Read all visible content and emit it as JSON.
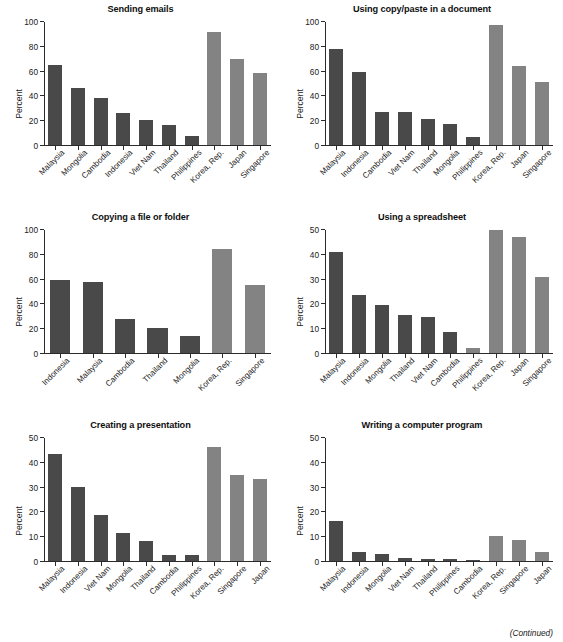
{
  "figure": {
    "footer_note": "(Continued)",
    "y_axis_label": "Percent",
    "colors": {
      "dark_bar": "#494949",
      "light_bar": "#838383",
      "axis": "#2b2b2b",
      "background": "#ffffff"
    }
  },
  "chart_data": [
    {
      "type": "bar",
      "title": "Sending emails",
      "xlabel": "",
      "ylabel": "Percent",
      "ylim": [
        0,
        100
      ],
      "yticks": [
        0,
        20,
        40,
        60,
        80,
        100
      ],
      "grid": false,
      "legend": "none",
      "categories": [
        "Malaysia",
        "Mongolia",
        "Cambodia",
        "Indonesia",
        "Viet Nam",
        "Thailand",
        "Philippines",
        "Korea, Rep.",
        "Japan",
        "Singapore"
      ],
      "values": [
        65,
        46.5,
        38,
        26,
        20.5,
        16,
        7,
        91.5,
        70,
        58.5
      ],
      "bar_groups": [
        "dark",
        "dark",
        "dark",
        "dark",
        "dark",
        "dark",
        "dark",
        "light",
        "light",
        "light"
      ]
    },
    {
      "type": "bar",
      "title": "Using copy/paste in a document",
      "xlabel": "",
      "ylabel": "Percent",
      "ylim": [
        0,
        100
      ],
      "yticks": [
        0,
        20,
        40,
        60,
        80,
        100
      ],
      "grid": false,
      "legend": "none",
      "categories": [
        "Malaysia",
        "Indonesia",
        "Cambodia",
        "Viet Nam",
        "Thailand",
        "Mongolia",
        "Philippines",
        "Korea, Rep.",
        "Japan",
        "Singapore"
      ],
      "values": [
        78,
        59.5,
        27,
        26.5,
        21,
        17,
        6.5,
        97.5,
        64,
        51
      ],
      "bar_groups": [
        "dark",
        "dark",
        "dark",
        "dark",
        "dark",
        "dark",
        "dark",
        "light",
        "light",
        "light"
      ]
    },
    {
      "type": "bar",
      "title": "Copying a file or folder",
      "xlabel": "",
      "ylabel": "Percent",
      "ylim": [
        0,
        100
      ],
      "yticks": [
        0,
        20,
        40,
        60,
        80,
        100
      ],
      "grid": false,
      "legend": "none",
      "categories": [
        "Indonesia",
        "Malaysia",
        "Cambodia",
        "Thailand",
        "Mongolia",
        "Korea, Rep.",
        "Singapore"
      ],
      "values": [
        59,
        57.5,
        28,
        20.5,
        14,
        84.5,
        55.5
      ],
      "bar_groups": [
        "dark",
        "dark",
        "dark",
        "dark",
        "dark",
        "light",
        "light"
      ]
    },
    {
      "type": "bar",
      "title": "Using a spreadsheet",
      "xlabel": "",
      "ylabel": "Percent",
      "ylim": [
        0,
        50
      ],
      "yticks": [
        0,
        10,
        20,
        30,
        40,
        50
      ],
      "grid": false,
      "legend": "none",
      "categories": [
        "Malaysia",
        "Indonesia",
        "Mongolia",
        "Thailand",
        "Viet Nam",
        "Cambodia",
        "Philippines",
        "Korea, Rep.",
        "Japan",
        "Singapore"
      ],
      "values": [
        41,
        23.5,
        19.5,
        15.3,
        14.8,
        8.4,
        1.9,
        50,
        47,
        31
      ],
      "bar_groups": [
        "dark",
        "dark",
        "dark",
        "dark",
        "dark",
        "dark",
        "light",
        "light",
        "light",
        "light"
      ]
    },
    {
      "type": "bar",
      "title": "Creating a presentation",
      "xlabel": "",
      "ylabel": "Percent",
      "ylim": [
        0,
        50
      ],
      "yticks": [
        0,
        10,
        20,
        30,
        40,
        50
      ],
      "grid": false,
      "legend": "none",
      "categories": [
        "Malaysia",
        "Indonesia",
        "Viet Nam",
        "Mongolia",
        "Thailand",
        "Cambodia",
        "Philippines",
        "Korea, Rep.",
        "Singapore",
        "Japan"
      ],
      "values": [
        43.3,
        30.2,
        18.6,
        11.3,
        8.1,
        2.5,
        2.3,
        46.5,
        34.8,
        33.4
      ],
      "bar_groups": [
        "dark",
        "dark",
        "dark",
        "dark",
        "dark",
        "dark",
        "dark",
        "light",
        "light",
        "light"
      ]
    },
    {
      "type": "bar",
      "title": "Writing a computer program",
      "xlabel": "",
      "ylabel": "Percent",
      "ylim": [
        0,
        50
      ],
      "yticks": [
        0,
        10,
        20,
        30,
        40,
        50
      ],
      "grid": false,
      "legend": "none",
      "categories": [
        "Malaysia",
        "Indonesia",
        "Mongolia",
        "Viet Nam",
        "Thailand",
        "Philippines",
        "Cambodia",
        "Korea, Rep.",
        "Singapore",
        "Japan"
      ],
      "values": [
        16.2,
        3.7,
        2.8,
        1.3,
        0.8,
        0.8,
        0.1,
        10.2,
        8.7,
        3.8
      ],
      "bar_groups": [
        "dark",
        "dark",
        "dark",
        "dark",
        "dark",
        "dark",
        "dark",
        "light",
        "light",
        "light"
      ]
    }
  ]
}
